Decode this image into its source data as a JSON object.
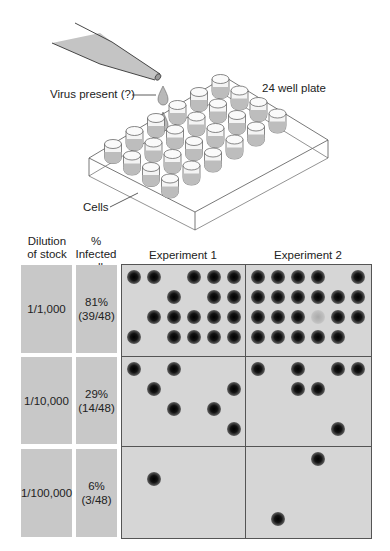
{
  "diagram": {
    "pipette_label": "Virus present (?)",
    "plate_label": "24 well plate",
    "cells_label": "Cells",
    "plate_well_count": 24
  },
  "table": {
    "headers": {
      "dilution": "Dilution of stock",
      "dilution_line1": "Dilution",
      "dilution_line2": "of stock",
      "infected_line1": "% Infected",
      "infected_line2": "wells",
      "experiment1": "Experiment 1",
      "experiment2": "Experiment 2"
    },
    "rows": [
      {
        "dilution": "1/1,000",
        "percent": "81%",
        "fraction": "(39/48)",
        "exp1_wells": [
          [
            1,
            1,
            0,
            1,
            1,
            1
          ],
          [
            0,
            0,
            1,
            0,
            1,
            1
          ],
          [
            0,
            1,
            1,
            1,
            1,
            1
          ],
          [
            1,
            0,
            1,
            1,
            1,
            1
          ]
        ],
        "exp2_wells": [
          [
            1,
            1,
            1,
            1,
            0,
            1
          ],
          [
            1,
            1,
            1,
            1,
            1,
            1
          ],
          [
            1,
            1,
            1,
            2,
            1,
            1
          ],
          [
            1,
            1,
            1,
            1,
            1,
            0
          ]
        ]
      },
      {
        "dilution": "1/10,000",
        "percent": "29%",
        "fraction": "(14/48)",
        "exp1_wells": [
          [
            1,
            0,
            1,
            0,
            0,
            0
          ],
          [
            0,
            1,
            0,
            0,
            0,
            1
          ],
          [
            0,
            0,
            1,
            0,
            1,
            0
          ],
          [
            0,
            0,
            0,
            0,
            0,
            1
          ]
        ],
        "exp2_wells": [
          [
            1,
            0,
            1,
            0,
            1,
            1
          ],
          [
            0,
            0,
            1,
            1,
            0,
            0
          ],
          [
            0,
            0,
            0,
            0,
            0,
            0
          ],
          [
            0,
            0,
            0,
            0,
            1,
            0
          ]
        ]
      },
      {
        "dilution": "1/100,000",
        "percent": "6%",
        "fraction": "(3/48)",
        "exp1_wells": [
          [
            0,
            0,
            0,
            0,
            0,
            0
          ],
          [
            0,
            1,
            0,
            0,
            0,
            0
          ],
          [
            0,
            0,
            0,
            0,
            0,
            0
          ],
          [
            0,
            0,
            0,
            0,
            0,
            0
          ]
        ],
        "exp2_wells": [
          [
            0,
            0,
            0,
            1,
            0,
            0
          ],
          [
            0,
            0,
            0,
            0,
            0,
            0
          ],
          [
            0,
            0,
            0,
            0,
            0,
            0
          ],
          [
            0,
            1,
            0,
            0,
            0,
            0
          ]
        ]
      }
    ],
    "legend_note": "1 = infected well (dark plaque), 2 = faint/uncertain well, 0 = uninfected"
  },
  "colors": {
    "panel_bg": "#d6d6d6",
    "label_box_bg": "#c8c8c8",
    "border": "#555555",
    "plaque": "#000000",
    "liquid": "#bdbdbd"
  }
}
